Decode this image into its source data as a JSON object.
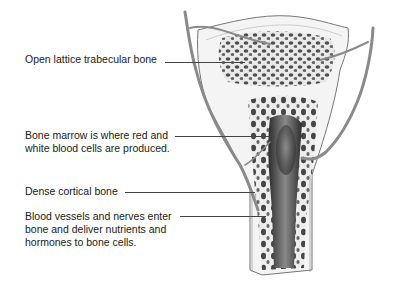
{
  "diagram": {
    "labels": [
      {
        "id": "trabecular",
        "lines": [
          "Open lattice trabecular bone"
        ]
      },
      {
        "id": "marrow",
        "lines": [
          "Bone marrow is where red and",
          "white blood cells are produced."
        ]
      },
      {
        "id": "cortical",
        "lines": [
          "Dense cortical bone"
        ]
      },
      {
        "id": "vessels",
        "lines": [
          "Blood vessels and nerves enter",
          "bone and deliver nutrients and",
          "hormones to bone cells."
        ]
      }
    ],
    "colors": {
      "text": "#1a1a1a",
      "leader": "#444444",
      "vessel": "#8a8a8a",
      "bone_fill": "#f2f2f2",
      "marrow_dark": "#3a3a3a"
    }
  }
}
